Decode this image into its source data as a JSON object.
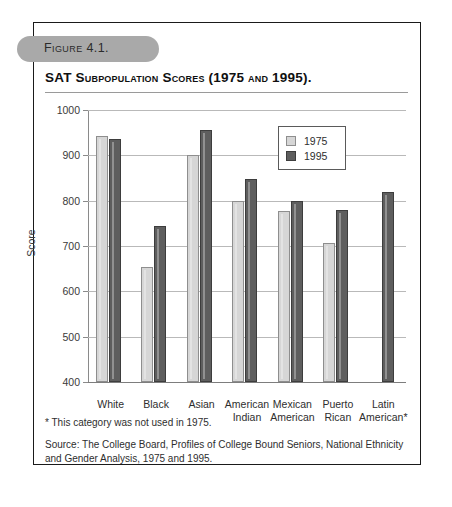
{
  "figure": {
    "pill_label": "Figure 4.1.",
    "title": "SAT Subpopulation Scores (1975 and 1995)."
  },
  "legend": {
    "entries": [
      {
        "label": "1975",
        "color": "#d6d6d6"
      },
      {
        "label": "1995",
        "color": "#5e5e5e"
      }
    ]
  },
  "notes": {
    "footnote": "* This category was not used in 1975.",
    "source": "Source: The College Board, Profiles of College Bound Seniors, National Ethnicity and Gender Analysis, 1975 and 1995."
  },
  "axis": {
    "y_ticks": [
      "1000",
      "900",
      "800",
      "700",
      "600",
      "500",
      "400"
    ],
    "y_title": "Score"
  },
  "chart_data": {
    "type": "bar",
    "title": "SAT Subpopulation Scores (1975 and 1995).",
    "xlabel": "",
    "ylabel": "Score",
    "ylim": [
      400,
      1000
    ],
    "ytick_step": 100,
    "grid": true,
    "legend_position": "top-right",
    "categories": [
      "White",
      "Black",
      "Asian",
      "American Indian",
      "Mexican American",
      "Puerto Rican",
      "Latin American*"
    ],
    "category_lines": [
      [
        "White",
        ""
      ],
      [
        "Black",
        ""
      ],
      [
        "Asian",
        ""
      ],
      [
        "American",
        "Indian"
      ],
      [
        "Mexican",
        "American"
      ],
      [
        "Puerto",
        "Rican"
      ],
      [
        "Latin",
        "American*"
      ]
    ],
    "series": [
      {
        "name": "1975",
        "color": "#d6d6d6",
        "values": [
          943,
          653,
          900,
          800,
          777,
          707,
          null
        ]
      },
      {
        "name": "1995",
        "color": "#5e5e5e",
        "values": [
          935,
          744,
          955,
          848,
          800,
          779,
          820
        ]
      }
    ],
    "annotations": [
      "* This category was not used in 1975."
    ]
  }
}
